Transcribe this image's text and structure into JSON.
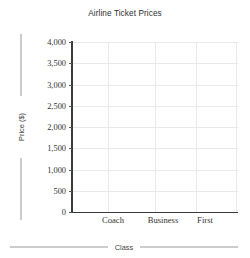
{
  "chart_data": {
    "type": "bar",
    "title": "Airline Ticket Prices",
    "xlabel": "Class",
    "ylabel": "Price ($)",
    "categories": [
      "Coach",
      "Business",
      "First"
    ],
    "values": [
      null,
      null,
      null
    ],
    "series": [],
    "ylim": [
      0,
      4000
    ],
    "ytick_values": [
      0,
      500,
      1000,
      1500,
      2000,
      2500,
      3000,
      3500,
      4000
    ],
    "ytick_labels": [
      "0",
      "500",
      "1,000",
      "1,500",
      "2,000",
      "2,500",
      "3,000",
      "3,500",
      "4,000"
    ],
    "ytick_step": 500,
    "grid": {
      "horizontal": true,
      "vertical": true,
      "color": "#e9e9e9"
    },
    "legend": {
      "visible": false,
      "position": "none",
      "entries": []
    },
    "annotations": [],
    "note": "Empty plotting grid — no data series drawn",
    "colors": {
      "background": "#ffffff",
      "axis": "#3b3b3b",
      "gridline": "#e9e9e9",
      "title_text": "#2e2e2e",
      "tick_text": "#333333",
      "axis_label_text": "#444444",
      "rule": "#9a9a9a"
    }
  },
  "vertical_gridline_positions": [
    108,
    155,
    196,
    236
  ],
  "category_label_positions": [
    113,
    163,
    205
  ]
}
